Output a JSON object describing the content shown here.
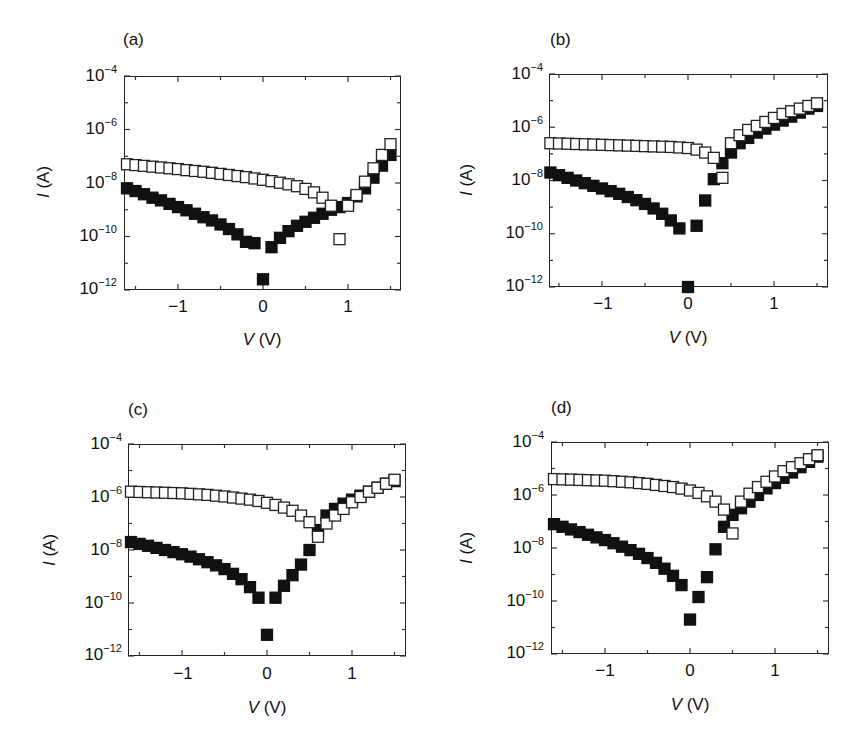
{
  "figure": {
    "panels": [
      {
        "label": "(a)",
        "xlabel_var": "V",
        "xlabel_unit": " (V)",
        "ylabel_var": "I",
        "ylabel_unit": " (A)"
      },
      {
        "label": "(b)",
        "xlabel_var": "V",
        "xlabel_unit": " (V)",
        "ylabel_var": "I",
        "ylabel_unit": " (A)"
      },
      {
        "label": "(c)",
        "xlabel_var": "V",
        "xlabel_unit": " (V)",
        "ylabel_var": "I",
        "ylabel_unit": " (A)"
      },
      {
        "label": "(d)",
        "xlabel_var": "V",
        "xlabel_unit": " (V)",
        "ylabel_var": "I",
        "ylabel_unit": " (A)"
      }
    ],
    "y_ticks": [
      {
        "base": "10",
        "exp": "−4"
      },
      {
        "base": "10",
        "exp": "−6"
      },
      {
        "base": "10",
        "exp": "−8"
      },
      {
        "base": "10",
        "exp": "−10"
      },
      {
        "base": "10",
        "exp": "−12"
      }
    ],
    "x_ticks": [
      "−1",
      "0",
      "1"
    ]
  },
  "chart_data": [
    {
      "type": "scatter",
      "title": "(a)",
      "xlabel": "V (V)",
      "ylabel": "I (A)",
      "xlim": [
        -1.65,
        1.6
      ],
      "ylim": [
        1e-12,
        0.0001
      ],
      "yscale": "log",
      "x_ticks": [
        -1,
        0,
        1
      ],
      "y_ticks": [
        "1e-4",
        "1e-6",
        "1e-8",
        "1e-10",
        "1e-12"
      ],
      "grid": false,
      "x": [
        -1.6,
        -1.5,
        -1.4,
        -1.3,
        -1.2,
        -1.1,
        -1.0,
        -0.9,
        -0.8,
        -0.7,
        -0.6,
        -0.5,
        -0.4,
        -0.3,
        -0.2,
        -0.1,
        0.0,
        0.1,
        0.2,
        0.3,
        0.4,
        0.5,
        0.6,
        0.7,
        0.8,
        0.9,
        1.0,
        1.1,
        1.2,
        1.3,
        1.4,
        1.5
      ],
      "series": [
        {
          "name": "open squares",
          "marker": "open-square",
          "log10_values": [
            -7.3,
            -7.33,
            -7.36,
            -7.39,
            -7.42,
            -7.45,
            -7.48,
            -7.52,
            -7.55,
            -7.58,
            -7.62,
            -7.66,
            -7.7,
            -7.74,
            -7.78,
            -7.83,
            -7.88,
            -7.93,
            -7.99,
            -8.05,
            -8.12,
            -8.22,
            -8.35,
            -8.55,
            -8.85,
            -10.1,
            -8.85,
            -8.45,
            -7.95,
            -7.45,
            -6.95,
            -6.55
          ]
        },
        {
          "name": "filled squares",
          "marker": "filled-square",
          "log10_values": [
            -8.2,
            -8.3,
            -8.42,
            -8.55,
            -8.65,
            -8.78,
            -8.9,
            -9.02,
            -9.15,
            -9.28,
            -9.4,
            -9.55,
            -9.72,
            -9.92,
            -10.2,
            -10.25,
            -11.6,
            -10.4,
            -10.05,
            -9.8,
            -9.6,
            -9.45,
            -9.3,
            -9.15,
            -9.0,
            -8.9,
            -8.75,
            -8.5,
            -8.2,
            -7.8,
            -7.35,
            -6.95
          ]
        }
      ]
    },
    {
      "type": "scatter",
      "title": "(b)",
      "xlabel": "V (V)",
      "ylabel": "I (A)",
      "xlim": [
        -1.65,
        1.6
      ],
      "ylim": [
        1e-12,
        0.0001
      ],
      "yscale": "log",
      "x_ticks": [
        -1,
        0,
        1
      ],
      "y_ticks": [
        "1e-4",
        "1e-6",
        "1e-8",
        "1e-10",
        "1e-12"
      ],
      "grid": false,
      "x": [
        -1.6,
        -1.5,
        -1.4,
        -1.3,
        -1.2,
        -1.1,
        -1.0,
        -0.9,
        -0.8,
        -0.7,
        -0.6,
        -0.5,
        -0.4,
        -0.3,
        -0.2,
        -0.1,
        0.0,
        0.1,
        0.2,
        0.3,
        0.4,
        0.5,
        0.6,
        0.7,
        0.8,
        0.9,
        1.0,
        1.1,
        1.2,
        1.3,
        1.4,
        1.5
      ],
      "series": [
        {
          "name": "open squares",
          "marker": "open-square",
          "log10_values": [
            -6.6,
            -6.61,
            -6.62,
            -6.63,
            -6.64,
            -6.65,
            -6.66,
            -6.67,
            -6.68,
            -6.69,
            -6.7,
            -6.71,
            -6.72,
            -6.73,
            -6.74,
            -6.76,
            -6.78,
            -6.84,
            -6.95,
            -7.15,
            -7.9,
            -6.6,
            -6.3,
            -6.1,
            -5.95,
            -5.8,
            -5.65,
            -5.5,
            -5.4,
            -5.3,
            -5.2,
            -5.1
          ]
        },
        {
          "name": "filled squares",
          "marker": "filled-square",
          "log10_values": [
            -7.7,
            -7.8,
            -7.9,
            -8.0,
            -8.1,
            -8.2,
            -8.3,
            -8.4,
            -8.5,
            -8.62,
            -8.74,
            -8.88,
            -9.05,
            -9.25,
            -9.5,
            -9.8,
            -12.0,
            -9.7,
            -8.75,
            -7.95,
            -7.35,
            -6.95,
            -6.6,
            -6.4,
            -6.2,
            -6.05,
            -5.9,
            -5.75,
            -5.6,
            -5.45,
            -5.3,
            -5.2
          ]
        }
      ]
    },
    {
      "type": "scatter",
      "title": "(c)",
      "xlabel": "V (V)",
      "ylabel": "I (A)",
      "xlim": [
        -1.65,
        1.6
      ],
      "ylim": [
        1e-12,
        0.0001
      ],
      "yscale": "log",
      "x_ticks": [
        -1,
        0,
        1
      ],
      "y_ticks": [
        "1e-4",
        "1e-6",
        "1e-8",
        "1e-10",
        "1e-12"
      ],
      "grid": false,
      "x": [
        -1.6,
        -1.5,
        -1.4,
        -1.3,
        -1.2,
        -1.1,
        -1.0,
        -0.9,
        -0.8,
        -0.7,
        -0.6,
        -0.5,
        -0.4,
        -0.3,
        -0.2,
        -0.1,
        0.0,
        0.1,
        0.2,
        0.3,
        0.4,
        0.5,
        0.6,
        0.7,
        0.8,
        0.9,
        1.0,
        1.1,
        1.2,
        1.3,
        1.4,
        1.5
      ],
      "series": [
        {
          "name": "open squares",
          "marker": "open-square",
          "log10_values": [
            -5.8,
            -5.81,
            -5.82,
            -5.83,
            -5.84,
            -5.85,
            -5.86,
            -5.88,
            -5.9,
            -5.92,
            -5.95,
            -5.98,
            -6.02,
            -6.06,
            -6.1,
            -6.15,
            -6.22,
            -6.3,
            -6.4,
            -6.52,
            -6.7,
            -6.95,
            -7.5,
            -7.0,
            -6.7,
            -6.45,
            -6.2,
            -6.0,
            -5.8,
            -5.65,
            -5.5,
            -5.35
          ]
        },
        {
          "name": "filled squares",
          "marker": "filled-square",
          "log10_values": [
            -7.7,
            -7.77,
            -7.84,
            -7.92,
            -8.0,
            -8.08,
            -8.16,
            -8.25,
            -8.35,
            -8.46,
            -8.58,
            -8.72,
            -8.9,
            -9.1,
            -9.4,
            -9.8,
            -11.2,
            -9.8,
            -9.35,
            -8.95,
            -8.55,
            -8.0,
            -7.25,
            -6.7,
            -6.45,
            -6.25,
            -6.1,
            -5.95,
            -5.8,
            -5.65,
            -5.5,
            -5.4
          ]
        }
      ]
    },
    {
      "type": "scatter",
      "title": "(d)",
      "xlabel": "V (V)",
      "ylabel": "I (A)",
      "xlim": [
        -1.65,
        1.6
      ],
      "ylim": [
        1e-12,
        0.0001
      ],
      "yscale": "log",
      "x_ticks": [
        -1,
        0,
        1
      ],
      "y_ticks": [
        "1e-4",
        "1e-6",
        "1e-8",
        "1e-10",
        "1e-12"
      ],
      "grid": false,
      "x": [
        -1.6,
        -1.5,
        -1.4,
        -1.3,
        -1.2,
        -1.1,
        -1.0,
        -0.9,
        -0.8,
        -0.7,
        -0.6,
        -0.5,
        -0.4,
        -0.3,
        -0.2,
        -0.1,
        0.0,
        0.1,
        0.2,
        0.3,
        0.4,
        0.5,
        0.6,
        0.7,
        0.8,
        0.9,
        1.0,
        1.1,
        1.2,
        1.3,
        1.4,
        1.5
      ],
      "series": [
        {
          "name": "open squares",
          "marker": "open-square",
          "log10_values": [
            -5.4,
            -5.41,
            -5.42,
            -5.43,
            -5.44,
            -5.45,
            -5.46,
            -5.48,
            -5.5,
            -5.52,
            -5.55,
            -5.58,
            -5.62,
            -5.66,
            -5.7,
            -5.76,
            -5.83,
            -5.92,
            -6.05,
            -6.25,
            -6.55,
            -7.45,
            -6.25,
            -5.95,
            -5.7,
            -5.5,
            -5.3,
            -5.1,
            -4.95,
            -4.8,
            -4.65,
            -4.5
          ]
        },
        {
          "name": "filled squares",
          "marker": "filled-square",
          "log10_values": [
            -7.1,
            -7.2,
            -7.3,
            -7.4,
            -7.5,
            -7.6,
            -7.7,
            -7.82,
            -7.95,
            -8.08,
            -8.22,
            -8.38,
            -8.56,
            -8.78,
            -9.05,
            -9.4,
            -10.7,
            -9.85,
            -9.1,
            -8.05,
            -7.2,
            -6.75,
            -6.5,
            -6.25,
            -6.0,
            -5.75,
            -5.55,
            -5.35,
            -5.15,
            -4.95,
            -4.75,
            -4.55
          ]
        }
      ]
    }
  ]
}
